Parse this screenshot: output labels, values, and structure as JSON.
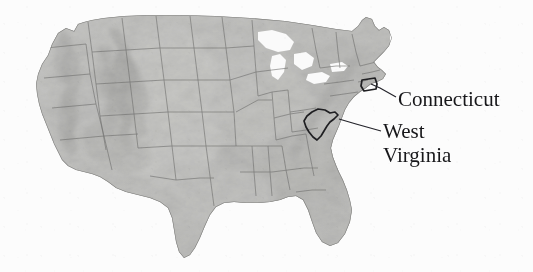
{
  "figure": {
    "kind": "relief-map",
    "region": "Contiguous United States",
    "style": "grayscale shaded-relief with state boundaries",
    "background_color": "#fcfcfc",
    "land_tone_light": "#d2d2d0",
    "land_tone_mid": "#b4b4b2",
    "land_tone_dark": "#8f8f8d",
    "boundary_color": "#6e6e6c",
    "highlight_outline_color": "#1f1f22",
    "leader_line_color": "#23232a"
  },
  "annotations": [
    {
      "id": "connecticut",
      "label": "Connecticut",
      "label_x": 398,
      "label_y": 106,
      "font_size": 21,
      "leader_from_x": 371,
      "leader_from_y": 84,
      "leader_to_x": 396,
      "leader_to_y": 97
    },
    {
      "id": "west-virginia",
      "label_line_1": "West",
      "label_line_2": "Virginia",
      "label_x": 383,
      "label_y_line_1": 138,
      "label_y_line_2": 162,
      "font_size": 21,
      "leader_from_x": 339,
      "leader_from_y": 119,
      "leader_to_x": 381,
      "leader_to_y": 131
    }
  ],
  "highlighted_states": [
    "Connecticut",
    "West Virginia"
  ]
}
